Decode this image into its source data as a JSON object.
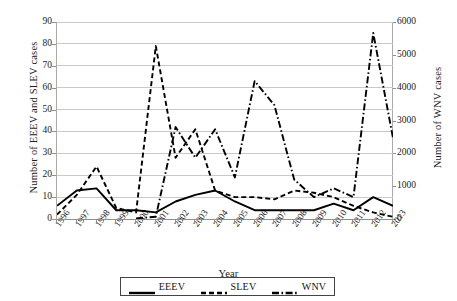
{
  "chart_data": {
    "type": "line",
    "title": "",
    "xlabel": "Year",
    "ylabel": "Number of EEEV and SLEV cases",
    "ylabel_secondary": "Number of WNV cases",
    "categories": [
      "1996",
      "1997",
      "1998",
      "1999",
      "2000",
      "2001",
      "2002",
      "2003",
      "2004",
      "2005",
      "2006",
      "2007",
      "2008",
      "2009",
      "2010",
      "2011",
      "2012",
      "2013"
    ],
    "ylim": [
      0,
      90
    ],
    "yticks": [
      "0",
      "10",
      "20",
      "30",
      "40",
      "50",
      "60",
      "70",
      "80",
      "90"
    ],
    "ylim_secondary": [
      0,
      6000
    ],
    "yticks_secondary": [
      "0",
      "1000",
      "2000",
      "3000",
      "4000",
      "5000",
      "6000"
    ],
    "grid": true,
    "legend_position": "bottom",
    "series": [
      {
        "name": "EEEV",
        "axis": "left",
        "style": "solid",
        "values": [
          6,
          13,
          14,
          4,
          4,
          3,
          8,
          11,
          13,
          8,
          4,
          4,
          4,
          4,
          7,
          4,
          10,
          6
        ]
      },
      {
        "name": "SLEV",
        "axis": "left",
        "style": "dashed",
        "values": [
          2,
          11,
          24,
          5,
          3,
          79,
          28,
          41,
          13,
          10,
          10,
          9,
          13,
          12,
          10,
          6,
          3,
          1
        ]
      },
      {
        "name": "WNV",
        "axis": "right",
        "style": "dash-dot",
        "values": [
          null,
          null,
          null,
          null,
          21,
          66,
          2946,
          9862,
          2539,
          3000,
          4269,
          3630,
          1356,
          720,
          1021,
          712,
          5674,
          2469
        ],
        "values_left_scale": [
          null,
          null,
          null,
          null,
          0.3,
          1,
          42,
          28,
          41,
          19,
          63,
          52,
          18,
          10,
          14,
          10,
          85,
          37
        ]
      }
    ]
  },
  "legend": {
    "items": [
      {
        "label": "EEEV",
        "style": "solid"
      },
      {
        "label": "SLEV",
        "style": "dashed"
      },
      {
        "label": "WNV",
        "style": "dash-dot"
      }
    ]
  },
  "colors": {
    "line": "#000000",
    "grid": "#c9c9c9",
    "axis": "#8f8f8f",
    "text": "#1a1a1a"
  }
}
